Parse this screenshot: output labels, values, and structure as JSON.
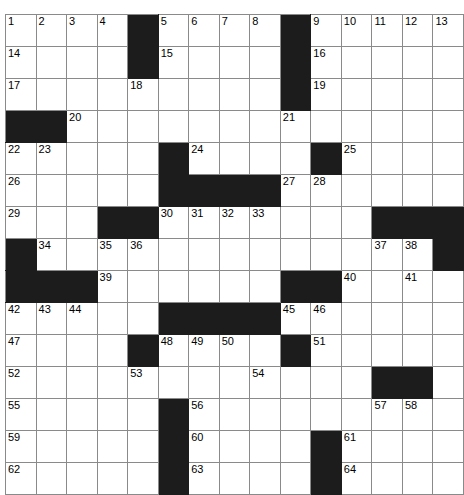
{
  "puzzle": {
    "type": "crossword-grid",
    "rows": 15,
    "cols": 14,
    "cell_size_px": 31,
    "colors": {
      "block": "#1c1c1c",
      "open": "#ffffff",
      "grid_line": "#8a8a8a",
      "number_text": "#000000",
      "page_background": "#ffffff"
    },
    "numbers_present": [
      1,
      2,
      3,
      4,
      5,
      6,
      7,
      8,
      9,
      10,
      11,
      12,
      13,
      14,
      15,
      16,
      17,
      18,
      19,
      20,
      21,
      22,
      23,
      24,
      25,
      26,
      27,
      28,
      29,
      30,
      31,
      32,
      33,
      34,
      35,
      36,
      37,
      38,
      39,
      40,
      41,
      42,
      43,
      44,
      45,
      46,
      47,
      48,
      49,
      50,
      51,
      52,
      53,
      54,
      55,
      56,
      57,
      58,
      59,
      60,
      61,
      62,
      63,
      64
    ],
    "max_number": 64,
    "grid": [
      [
        {
          "block": false,
          "num": "1"
        },
        {
          "block": false,
          "num": "2"
        },
        {
          "block": false,
          "num": "3"
        },
        {
          "block": false,
          "num": "4"
        },
        {
          "block": true,
          "num": ""
        },
        {
          "block": false,
          "num": "5"
        },
        {
          "block": false,
          "num": "6"
        },
        {
          "block": false,
          "num": "7"
        },
        {
          "block": false,
          "num": "8"
        },
        {
          "block": true,
          "num": ""
        },
        {
          "block": false,
          "num": "9"
        },
        {
          "block": false,
          "num": "10"
        },
        {
          "block": false,
          "num": "11"
        },
        {
          "block": false,
          "num": "12"
        },
        {
          "block": false,
          "num": "13"
        }
      ],
      [
        {
          "block": false,
          "num": "14"
        },
        {
          "block": false,
          "num": ""
        },
        {
          "block": false,
          "num": ""
        },
        {
          "block": false,
          "num": ""
        },
        {
          "block": true,
          "num": ""
        },
        {
          "block": false,
          "num": "15"
        },
        {
          "block": false,
          "num": ""
        },
        {
          "block": false,
          "num": ""
        },
        {
          "block": false,
          "num": ""
        },
        {
          "block": true,
          "num": ""
        },
        {
          "block": false,
          "num": "16"
        },
        {
          "block": false,
          "num": ""
        },
        {
          "block": false,
          "num": ""
        },
        {
          "block": false,
          "num": ""
        },
        {
          "block": false,
          "num": ""
        }
      ],
      [
        {
          "block": false,
          "num": "17"
        },
        {
          "block": false,
          "num": ""
        },
        {
          "block": false,
          "num": ""
        },
        {
          "block": false,
          "num": ""
        },
        {
          "block": false,
          "num": "18"
        },
        {
          "block": false,
          "num": ""
        },
        {
          "block": false,
          "num": ""
        },
        {
          "block": false,
          "num": ""
        },
        {
          "block": false,
          "num": ""
        },
        {
          "block": true,
          "num": ""
        },
        {
          "block": false,
          "num": "19"
        },
        {
          "block": false,
          "num": ""
        },
        {
          "block": false,
          "num": ""
        },
        {
          "block": false,
          "num": ""
        },
        {
          "block": false,
          "num": ""
        }
      ],
      [
        {
          "block": true,
          "num": ""
        },
        {
          "block": true,
          "num": ""
        },
        {
          "block": false,
          "num": "20"
        },
        {
          "block": false,
          "num": ""
        },
        {
          "block": false,
          "num": ""
        },
        {
          "block": false,
          "num": ""
        },
        {
          "block": false,
          "num": ""
        },
        {
          "block": false,
          "num": ""
        },
        {
          "block": false,
          "num": ""
        },
        {
          "block": false,
          "num": "21"
        },
        {
          "block": false,
          "num": ""
        },
        {
          "block": false,
          "num": ""
        },
        {
          "block": false,
          "num": ""
        },
        {
          "block": false,
          "num": ""
        },
        {
          "block": false,
          "num": ""
        }
      ],
      [
        {
          "block": false,
          "num": "22"
        },
        {
          "block": false,
          "num": "23"
        },
        {
          "block": false,
          "num": ""
        },
        {
          "block": false,
          "num": ""
        },
        {
          "block": false,
          "num": ""
        },
        {
          "block": true,
          "num": ""
        },
        {
          "block": false,
          "num": "24"
        },
        {
          "block": false,
          "num": ""
        },
        {
          "block": false,
          "num": ""
        },
        {
          "block": false,
          "num": ""
        },
        {
          "block": true,
          "num": ""
        },
        {
          "block": false,
          "num": "25"
        },
        {
          "block": false,
          "num": ""
        },
        {
          "block": false,
          "num": ""
        },
        {
          "block": false,
          "num": ""
        }
      ],
      [
        {
          "block": false,
          "num": "26"
        },
        {
          "block": false,
          "num": ""
        },
        {
          "block": false,
          "num": ""
        },
        {
          "block": false,
          "num": ""
        },
        {
          "block": false,
          "num": ""
        },
        {
          "block": true,
          "num": ""
        },
        {
          "block": true,
          "num": ""
        },
        {
          "block": true,
          "num": ""
        },
        {
          "block": true,
          "num": ""
        },
        {
          "block": false,
          "num": "27"
        },
        {
          "block": false,
          "num": "28"
        },
        {
          "block": false,
          "num": ""
        },
        {
          "block": false,
          "num": ""
        },
        {
          "block": false,
          "num": ""
        },
        {
          "block": false,
          "num": ""
        }
      ],
      [
        {
          "block": false,
          "num": "29"
        },
        {
          "block": false,
          "num": ""
        },
        {
          "block": false,
          "num": ""
        },
        {
          "block": true,
          "num": ""
        },
        {
          "block": true,
          "num": ""
        },
        {
          "block": false,
          "num": "30"
        },
        {
          "block": false,
          "num": "31"
        },
        {
          "block": false,
          "num": "32"
        },
        {
          "block": false,
          "num": "33"
        },
        {
          "block": false,
          "num": ""
        },
        {
          "block": false,
          "num": ""
        },
        {
          "block": false,
          "num": ""
        },
        {
          "block": true,
          "num": ""
        },
        {
          "block": true,
          "num": ""
        },
        {
          "block": true,
          "num": ""
        }
      ],
      [
        {
          "block": true,
          "num": ""
        },
        {
          "block": false,
          "num": "34"
        },
        {
          "block": false,
          "num": ""
        },
        {
          "block": false,
          "num": "35"
        },
        {
          "block": false,
          "num": "36"
        },
        {
          "block": false,
          "num": ""
        },
        {
          "block": false,
          "num": ""
        },
        {
          "block": false,
          "num": ""
        },
        {
          "block": false,
          "num": ""
        },
        {
          "block": false,
          "num": ""
        },
        {
          "block": false,
          "num": ""
        },
        {
          "block": false,
          "num": ""
        },
        {
          "block": false,
          "num": "37"
        },
        {
          "block": false,
          "num": "38"
        },
        {
          "block": true,
          "num": ""
        }
      ],
      [
        {
          "block": true,
          "num": ""
        },
        {
          "block": true,
          "num": ""
        },
        {
          "block": true,
          "num": ""
        },
        {
          "block": false,
          "num": "39"
        },
        {
          "block": false,
          "num": ""
        },
        {
          "block": false,
          "num": ""
        },
        {
          "block": false,
          "num": ""
        },
        {
          "block": false,
          "num": ""
        },
        {
          "block": false,
          "num": ""
        },
        {
          "block": true,
          "num": ""
        },
        {
          "block": true,
          "num": ""
        },
        {
          "block": false,
          "num": "40"
        },
        {
          "block": false,
          "num": ""
        },
        {
          "block": false,
          "num": "41"
        },
        {
          "block": false,
          "num": ""
        }
      ],
      [
        {
          "block": false,
          "num": "42"
        },
        {
          "block": false,
          "num": "43"
        },
        {
          "block": false,
          "num": "44"
        },
        {
          "block": false,
          "num": ""
        },
        {
          "block": false,
          "num": ""
        },
        {
          "block": true,
          "num": ""
        },
        {
          "block": true,
          "num": ""
        },
        {
          "block": true,
          "num": ""
        },
        {
          "block": true,
          "num": ""
        },
        {
          "block": false,
          "num": "45"
        },
        {
          "block": false,
          "num": "46"
        },
        {
          "block": false,
          "num": ""
        },
        {
          "block": false,
          "num": ""
        },
        {
          "block": false,
          "num": ""
        },
        {
          "block": false,
          "num": ""
        }
      ],
      [
        {
          "block": false,
          "num": "47"
        },
        {
          "block": false,
          "num": ""
        },
        {
          "block": false,
          "num": ""
        },
        {
          "block": false,
          "num": ""
        },
        {
          "block": true,
          "num": ""
        },
        {
          "block": false,
          "num": "48"
        },
        {
          "block": false,
          "num": "49"
        },
        {
          "block": false,
          "num": "50"
        },
        {
          "block": false,
          "num": ""
        },
        {
          "block": true,
          "num": ""
        },
        {
          "block": false,
          "num": "51"
        },
        {
          "block": false,
          "num": ""
        },
        {
          "block": false,
          "num": ""
        },
        {
          "block": false,
          "num": ""
        },
        {
          "block": false,
          "num": ""
        }
      ],
      [
        {
          "block": false,
          "num": "52"
        },
        {
          "block": false,
          "num": ""
        },
        {
          "block": false,
          "num": ""
        },
        {
          "block": false,
          "num": ""
        },
        {
          "block": false,
          "num": "53"
        },
        {
          "block": false,
          "num": ""
        },
        {
          "block": false,
          "num": ""
        },
        {
          "block": false,
          "num": ""
        },
        {
          "block": false,
          "num": "54"
        },
        {
          "block": false,
          "num": ""
        },
        {
          "block": false,
          "num": ""
        },
        {
          "block": false,
          "num": ""
        },
        {
          "block": true,
          "num": ""
        },
        {
          "block": true,
          "num": ""
        },
        {
          "block": false,
          "num": ""
        }
      ],
      [
        {
          "block": false,
          "num": "55"
        },
        {
          "block": false,
          "num": ""
        },
        {
          "block": false,
          "num": ""
        },
        {
          "block": false,
          "num": ""
        },
        {
          "block": false,
          "num": ""
        },
        {
          "block": true,
          "num": ""
        },
        {
          "block": false,
          "num": "56"
        },
        {
          "block": false,
          "num": ""
        },
        {
          "block": false,
          "num": ""
        },
        {
          "block": false,
          "num": ""
        },
        {
          "block": false,
          "num": ""
        },
        {
          "block": false,
          "num": ""
        },
        {
          "block": false,
          "num": "57"
        },
        {
          "block": false,
          "num": "58"
        },
        {
          "block": false,
          "num": ""
        }
      ],
      [
        {
          "block": false,
          "num": "59"
        },
        {
          "block": false,
          "num": ""
        },
        {
          "block": false,
          "num": ""
        },
        {
          "block": false,
          "num": ""
        },
        {
          "block": false,
          "num": ""
        },
        {
          "block": true,
          "num": ""
        },
        {
          "block": false,
          "num": "60"
        },
        {
          "block": false,
          "num": ""
        },
        {
          "block": false,
          "num": ""
        },
        {
          "block": false,
          "num": ""
        },
        {
          "block": true,
          "num": ""
        },
        {
          "block": false,
          "num": "61"
        },
        {
          "block": false,
          "num": ""
        },
        {
          "block": false,
          "num": ""
        },
        {
          "block": false,
          "num": ""
        }
      ],
      [
        {
          "block": false,
          "num": "62"
        },
        {
          "block": false,
          "num": ""
        },
        {
          "block": false,
          "num": ""
        },
        {
          "block": false,
          "num": ""
        },
        {
          "block": false,
          "num": ""
        },
        {
          "block": true,
          "num": ""
        },
        {
          "block": false,
          "num": "63"
        },
        {
          "block": false,
          "num": ""
        },
        {
          "block": false,
          "num": ""
        },
        {
          "block": false,
          "num": ""
        },
        {
          "block": true,
          "num": ""
        },
        {
          "block": false,
          "num": "64"
        },
        {
          "block": false,
          "num": ""
        },
        {
          "block": false,
          "num": ""
        },
        {
          "block": false,
          "num": ""
        }
      ]
    ]
  }
}
